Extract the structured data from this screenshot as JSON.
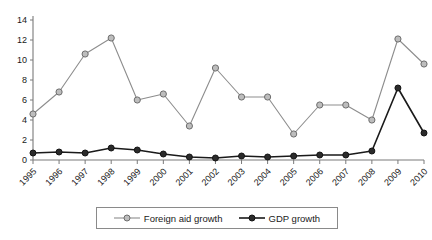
{
  "chart_data": {
    "type": "line",
    "title": "",
    "subtitle": "",
    "xlabel": "",
    "ylabel": "",
    "categories": [
      "1995",
      "1996",
      "1997",
      "1998",
      "1999",
      "2000",
      "2001",
      "2002",
      "2003",
      "2004",
      "2005",
      "2006",
      "2007",
      "2008",
      "2009",
      "2010"
    ],
    "series": [
      {
        "name": "Foreign aid growth",
        "color": "#8d8d8d",
        "marker": "open-circle",
        "values": [
          4.6,
          6.8,
          10.6,
          12.2,
          6.0,
          6.6,
          3.4,
          9.2,
          6.3,
          6.3,
          2.6,
          5.5,
          5.5,
          4.0,
          12.1,
          9.6
        ]
      },
      {
        "name": "GDP growth",
        "color": "#1a1a1a",
        "marker": "filled-circle",
        "values": [
          0.7,
          0.8,
          0.7,
          1.2,
          1.0,
          0.6,
          0.3,
          0.2,
          0.4,
          0.3,
          0.4,
          0.5,
          0.5,
          0.9,
          7.2,
          2.7
        ]
      }
    ],
    "yticks": [
      0,
      2,
      4,
      6,
      8,
      10,
      12,
      14
    ],
    "ylim": [
      0,
      14
    ],
    "xticks": [
      "1995",
      "1996",
      "1997",
      "1998",
      "1999",
      "2000",
      "2001",
      "2002",
      "2003",
      "2004",
      "2005",
      "2006",
      "2007",
      "2008",
      "2009",
      "2010"
    ],
    "grid": false,
    "legend_position": "bottom"
  },
  "legend": {
    "items": [
      {
        "label": "Foreign aid growth"
      },
      {
        "label": "GDP growth"
      }
    ]
  }
}
